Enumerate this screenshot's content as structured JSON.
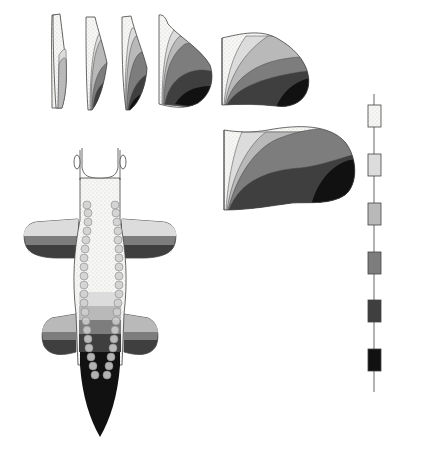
{
  "colors": {
    "D8": "#f6f6f4",
    "D9": "#dcdcdc",
    "D10": "#b9b9b9",
    "D11": "#7d7d7d",
    "D12": "#3f3f3f",
    "D13": "#111111",
    "outline": "#444444",
    "text": "#555555"
  },
  "stages": [
    {
      "label": "st.15"
    },
    {
      "label": "st.16"
    },
    {
      "label": "st.17"
    },
    {
      "label": "st.19"
    },
    {
      "label": "st.21"
    },
    {
      "label": "st.24"
    },
    {
      "label": "st.26"
    }
  ],
  "embryo": {
    "head_label": "Head",
    "tail_label": "Tail"
  },
  "gene_cluster": {
    "top_label": "3'",
    "bottom_label": "5'",
    "genes": [
      {
        "label": "D8"
      },
      {
        "label": "D9"
      },
      {
        "label": "D10"
      },
      {
        "label": "D11"
      },
      {
        "label": "D12"
      },
      {
        "label": "D13"
      }
    ]
  }
}
